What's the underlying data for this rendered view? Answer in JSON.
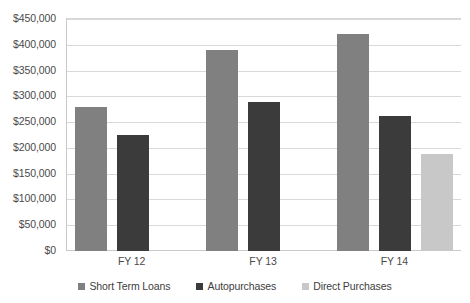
{
  "chart_data": {
    "type": "bar",
    "title": "",
    "xlabel": "",
    "ylabel": "",
    "categories": [
      "FY 12",
      "FY 13",
      "FY 14"
    ],
    "series": [
      {
        "name": "Short Term Loans",
        "color": "#808080",
        "values": [
          280000,
          390000,
          420000
        ]
      },
      {
        "name": "Autopurchases",
        "color": "#3b3b3b",
        "values": [
          225000,
          290000,
          262000
        ]
      },
      {
        "name": "Direct Purchases",
        "color": "#c8c8c8",
        "values": [
          null,
          null,
          188000
        ]
      }
    ],
    "ylim": [
      0,
      450000
    ],
    "y_tick_values": [
      0,
      50000,
      100000,
      150000,
      200000,
      250000,
      300000,
      350000,
      400000,
      450000
    ],
    "y_tick_labels": [
      "$0",
      "$50,000",
      "$100,000",
      "$150,000",
      "$200,000",
      "$250,000",
      "$300,000",
      "$350,000",
      "$400,000",
      "$450,000"
    ],
    "grid": true,
    "legend_position": "bottom",
    "legend_entries": [
      "Short Term Loans",
      "Autopurchases",
      "Direct Purchases"
    ]
  }
}
